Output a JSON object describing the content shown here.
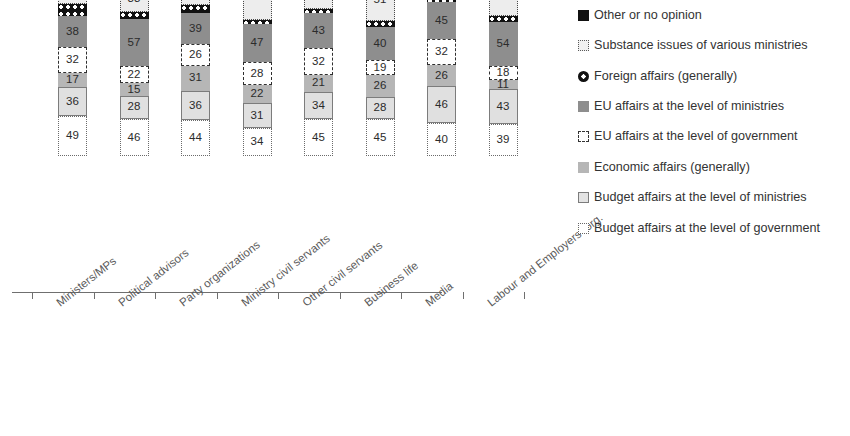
{
  "chart_data": {
    "type": "bar",
    "subtype": "stacked-column",
    "title": "",
    "subtitle": "",
    "xlabel": "",
    "ylabel": "",
    "grid": false,
    "legend_position": "right",
    "stacked_order_bottom_to_top": [
      "Budget affairs at the level of government",
      "Budget affairs at the level of ministries",
      "Economic affairs  (generally)",
      "EU affairs at the level of government",
      "EU affairs at the level of ministries",
      "Foreign affairs (generally)",
      "Substance issues of various ministries",
      "Other or no opinion"
    ],
    "categories": [
      "Ministers/MPs",
      "Political advisors",
      "Party organizations",
      "Ministry civil servants",
      "Other civil servants",
      "Business life",
      "Media",
      "Labour and Employers´ org."
    ],
    "series": [
      {
        "name": "Budget affairs at the level of government",
        "key": "budggov",
        "values": [
          49,
          46,
          44,
          34,
          45,
          45,
          40,
          39
        ]
      },
      {
        "name": "Budget affairs at the level of ministries",
        "key": "budgmin",
        "values": [
          36,
          28,
          36,
          31,
          34,
          28,
          46,
          43
        ]
      },
      {
        "name": "Economic affairs  (generally)",
        "key": "econ",
        "values": [
          17,
          15,
          31,
          22,
          21,
          26,
          26,
          11
        ]
      },
      {
        "name": "EU affairs at the level of government",
        "key": "eugov",
        "values": [
          32,
          22,
          26,
          28,
          32,
          19,
          32,
          18
        ]
      },
      {
        "name": "EU affairs at the level of ministries",
        "key": "eumin",
        "values": [
          38,
          57,
          39,
          47,
          43,
          40,
          45,
          54
        ]
      },
      {
        "name": "Foreign affairs (generally)",
        "key": "foreign",
        "values": [
          14,
          9,
          9,
          5,
          6,
          8,
          5,
          7
        ],
        "labels_shown": false
      },
      {
        "name": "Substance issues of various ministries",
        "key": "substance",
        "values": [
          32,
          33,
          36,
          58,
          49,
          51,
          51,
          54
        ]
      },
      {
        "name": "Other or no opinion",
        "key": "other",
        "values": [
          0,
          4,
          0,
          0,
          3,
          3,
          0,
          4
        ],
        "labels_shown": false
      }
    ]
  },
  "legend": {
    "items": [
      {
        "label": "Other or no opinion",
        "key": "other"
      },
      {
        "label": "Substance issues of various ministries",
        "key": "substance"
      },
      {
        "label": "Foreign affairs (generally)",
        "key": "foreign"
      },
      {
        "label": "EU affairs at the level of ministries",
        "key": "eumin"
      },
      {
        "label": "EU affairs at the level of government",
        "key": "eugov"
      },
      {
        "label": "Economic affairs  (generally)",
        "key": "econ"
      },
      {
        "label": "Budget affairs at the level of ministries",
        "key": "budgmin"
      },
      {
        "label": "Budget affairs at the level of government",
        "key": "budggov"
      }
    ]
  },
  "colors": {
    "other": "#111111",
    "substance": "#ededed",
    "foreign": "#111111",
    "eumin": "#8e8e8e",
    "eugov": "#ffffff",
    "econ": "#b6b6b6",
    "budgmin": "#e0e0e0",
    "budggov": "#ffffff",
    "axis": "#6f6f6f",
    "text": "#3a3a3a"
  }
}
